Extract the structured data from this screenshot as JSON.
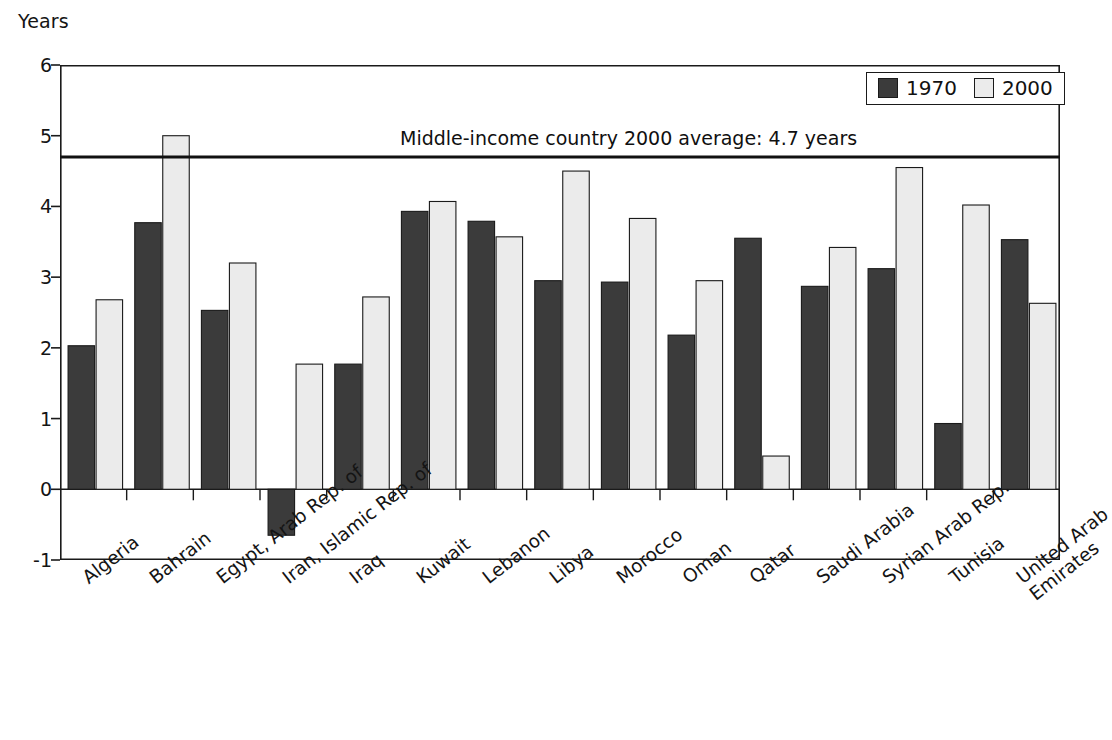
{
  "chart_data": {
    "type": "bar",
    "title": "",
    "subtitle": "",
    "xlabel": "",
    "ylabel": "Years",
    "ylim": [
      -1,
      6
    ],
    "yticks": [
      -1,
      0,
      1,
      2,
      3,
      4,
      5,
      6
    ],
    "ytick_labels": [
      "-1",
      "0",
      "1",
      "2",
      "3",
      "4",
      "5",
      "6"
    ],
    "grid": false,
    "legend_position": "top-right",
    "categories": [
      "Algeria",
      "Bahrain",
      "Egypt, Arab Rep. of",
      "Iran, Islamic Rep. of",
      "Iraq",
      "Kuwait",
      "Lebanon",
      "Libya",
      "Morocco",
      "Oman",
      "Qatar",
      "Saudi Arabia",
      "Syrian Arab Rep.",
      "Tunisia",
      "United Arab Emirates"
    ],
    "category_label_lines": [
      [
        "Algeria"
      ],
      [
        "Bahrain"
      ],
      [
        "Egypt, Arab Rep. of"
      ],
      [
        "Iran, Islamic Rep. of"
      ],
      [
        "Iraq"
      ],
      [
        "Kuwait"
      ],
      [
        "Lebanon"
      ],
      [
        "Libya"
      ],
      [
        "Morocco"
      ],
      [
        "Oman"
      ],
      [
        "Qatar"
      ],
      [
        "Saudi Arabia"
      ],
      [
        "Syrian Arab Rep."
      ],
      [
        "Tunisia"
      ],
      [
        "United Arab",
        "Emirates"
      ]
    ],
    "series": [
      {
        "name": "1970",
        "color": "#3b3b3b",
        "values": [
          2.03,
          3.77,
          2.53,
          -0.65,
          1.77,
          3.93,
          3.79,
          2.95,
          2.93,
          2.18,
          3.55,
          2.87,
          3.12,
          0.93,
          3.53
        ]
      },
      {
        "name": "2000",
        "color": "#ebebeb",
        "values": [
          2.68,
          5.0,
          3.2,
          1.77,
          2.72,
          4.07,
          3.57,
          4.5,
          3.83,
          2.95,
          0.47,
          3.42,
          4.55,
          4.02,
          2.63
        ]
      }
    ],
    "annotations": [
      {
        "text": "Middle-income country 2000 average: 4.7 years",
        "value": 4.7,
        "kind": "hline-with-label"
      }
    ]
  },
  "legend": {
    "items": [
      {
        "label": "1970",
        "swatch": "#3b3b3b"
      },
      {
        "label": "2000",
        "swatch": "#ebebeb"
      }
    ]
  },
  "colors": {
    "series_1970": "#3b3b3b",
    "series_2000": "#ebebeb",
    "axis": "#1a1a1a",
    "text": "#141414",
    "background": "#ffffff"
  }
}
